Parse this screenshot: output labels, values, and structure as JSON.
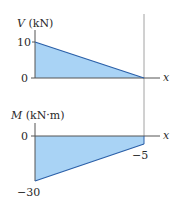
{
  "colors": {
    "fill": "#a9d3f5",
    "line": "#2a5fa8",
    "axis": "#555555",
    "text": "#2a2a2a"
  },
  "shear_diagram": {
    "y_axis_symbol": "V",
    "y_axis_unit": "(kN)",
    "x_axis_label": "x",
    "tick_labels": [
      "10",
      "0"
    ],
    "points": [
      {
        "x": 0,
        "V": 10
      },
      {
        "x": 1,
        "V": 0
      }
    ]
  },
  "moment_diagram": {
    "y_axis_symbol": "M",
    "y_axis_unit": "(kN·m)",
    "x_axis_label": "x",
    "tick_labels": [
      "0",
      "−30",
      "−5"
    ],
    "points": [
      {
        "x": 0,
        "M": -30
      },
      {
        "x": 1,
        "M": -5
      }
    ]
  }
}
